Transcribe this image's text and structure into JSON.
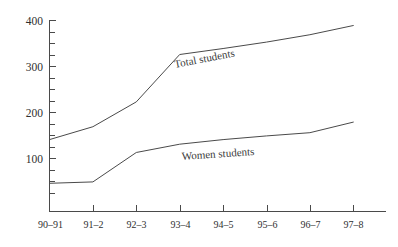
{
  "header": {
    "faint_top_text": ""
  },
  "chart_data": {
    "type": "line",
    "title": "",
    "xlabel": "",
    "ylabel": "",
    "categories": [
      "90–91",
      "91–2",
      "92–3",
      "93–4",
      "94–5",
      "95–6",
      "96–7",
      "97–8"
    ],
    "ylim": [
      0,
      400
    ],
    "y_ticks_major": [
      100,
      200,
      300,
      400
    ],
    "y_tick_labels": [
      "100",
      "200",
      "300",
      "400"
    ],
    "y_tick_minor_step": 25,
    "grid": false,
    "legend_position": "inline-annotation",
    "line_color": "#4a4a4a",
    "series": [
      {
        "name": "Total students",
        "label": "Total students",
        "values": [
          140,
          168,
          222,
          325,
          338,
          352,
          368,
          388
        ]
      },
      {
        "name": "Women students",
        "label": "Women students",
        "values": [
          45,
          48,
          112,
          130,
          140,
          148,
          155,
          178
        ]
      }
    ],
    "annotations": [
      {
        "text": "Total students",
        "series": "Total students",
        "rotation_deg": -11
      },
      {
        "text": "Women students",
        "series": "Women students",
        "rotation_deg": -4
      }
    ]
  }
}
